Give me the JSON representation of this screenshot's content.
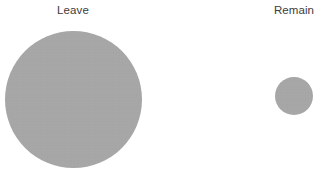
{
  "chart_data": {
    "type": "bubble",
    "title": "",
    "subtitle": "",
    "xlabel": "",
    "ylabel": "",
    "categories": [
      "Leave",
      "Remain"
    ],
    "values": [
      137,
      38
    ],
    "value_encoding": "circle diameter in pixels",
    "series": [
      {
        "name": "Vote share (area-proportional circles)",
        "values": [
          137,
          38
        ]
      }
    ],
    "points": [
      {
        "label": "Leave",
        "diameter": 137,
        "radius": 68.5,
        "center_x": 73,
        "center_y": 99,
        "relative_area": 13.0,
        "color": "#a9a9a9"
      },
      {
        "label": "Remain",
        "diameter": 38,
        "radius": 19,
        "center_x": 294,
        "center_y": 96,
        "relative_area": 1.0,
        "color": "#a9a9a9"
      }
    ],
    "grid": false,
    "legend": false,
    "legend_position": "none",
    "axes_visible": false,
    "background_color": "#ffffff",
    "bubble_color": "#a9a9a9",
    "label_color": "#3c3c3c"
  },
  "chart": {
    "background_color": "#ffffff",
    "bubbles": [
      {
        "key": "leave",
        "label": "Leave",
        "color": "#a9a9a9"
      },
      {
        "key": "remain",
        "label": "Remain",
        "color": "#a9a9a9"
      }
    ]
  }
}
